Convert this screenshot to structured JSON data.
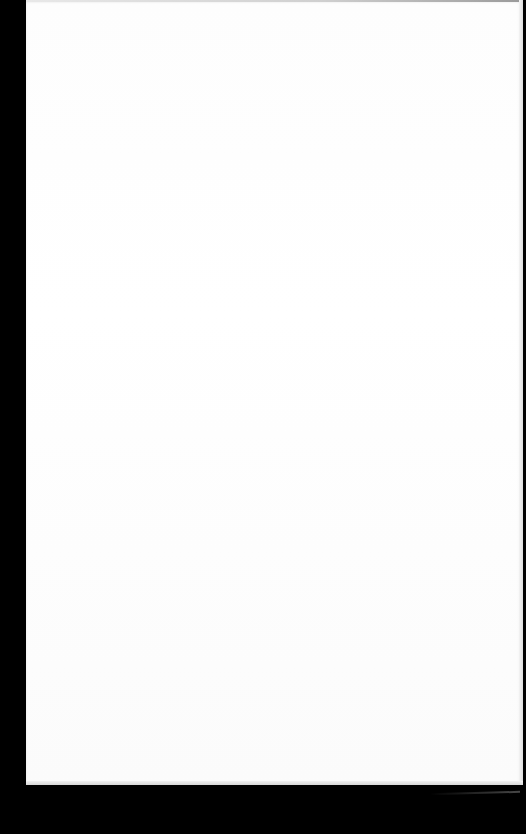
{
  "scene": {
    "description": "Blank white sheet of paper photographed on a black background",
    "background_color": "#000000",
    "paper_color": "#ffffff",
    "text_content": []
  }
}
